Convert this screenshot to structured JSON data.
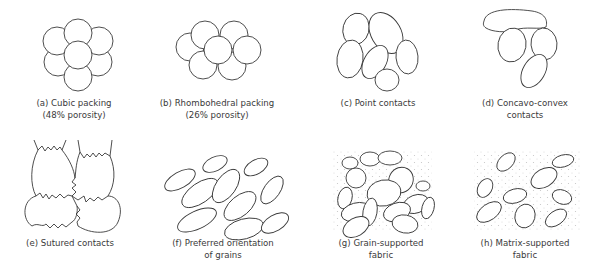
{
  "figure": {
    "panels": [
      {
        "id": "a",
        "line1": "(a)  Cubic packing",
        "line2": "(48% porosity)"
      },
      {
        "id": "b",
        "line1": "(b)  Rhombohedral packing",
        "line2": "(26% porosity)"
      },
      {
        "id": "c",
        "line1": "(c)  Point contacts",
        "line2": ""
      },
      {
        "id": "d",
        "line1": "(d)  Concavo-convex",
        "line2": "contacts"
      },
      {
        "id": "e",
        "line1": "(e)  Sutured contacts",
        "line2": ""
      },
      {
        "id": "f",
        "line1": "(f)  Preferred orientation",
        "line2": "of grains"
      },
      {
        "id": "g",
        "line1": "(g)  Grain-supported",
        "line2": "fabric"
      },
      {
        "id": "h",
        "line1": "(h)  Matrix-supported",
        "line2": "fabric"
      }
    ],
    "colors": {
      "stroke": "#3a3a3a",
      "text": "#3a3a3a",
      "matrix_dots": "#c8c8c8",
      "background": "#ffffff"
    }
  }
}
